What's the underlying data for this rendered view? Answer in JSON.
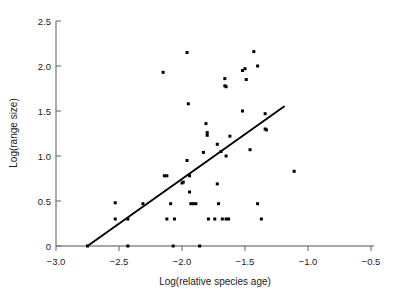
{
  "chart_data": {
    "type": "scatter",
    "title": "",
    "xlabel": "Log(relative species age)",
    "ylabel": "Log(range size)",
    "xlim": [
      -3.0,
      -0.5
    ],
    "ylim": [
      0,
      2.5
    ],
    "grid": false,
    "legend": null,
    "xticks": [
      -3.0,
      -2.5,
      -2.0,
      -1.5,
      -1.0,
      -0.5
    ],
    "xtick_labels": [
      "−3.0",
      "−2.5",
      "−2.0",
      "−1.5",
      "−1.0",
      "−0.5"
    ],
    "yticks": [
      0,
      0.5,
      1.0,
      1.5,
      2.0,
      2.5
    ],
    "ytick_labels": [
      "0",
      "0.5",
      "1.0",
      "1.5",
      "2.0",
      "2.5"
    ],
    "marker": "filled-square",
    "marker_color": "#000000",
    "points": [
      {
        "x": -2.75,
        "y": 0.0
      },
      {
        "x": -2.53,
        "y": 0.48
      },
      {
        "x": -2.53,
        "y": 0.3
      },
      {
        "x": -2.43,
        "y": 0.3
      },
      {
        "x": -2.43,
        "y": 0.0
      },
      {
        "x": -2.31,
        "y": 0.47
      },
      {
        "x": -2.15,
        "y": 1.93
      },
      {
        "x": -2.14,
        "y": 0.78
      },
      {
        "x": -2.12,
        "y": 0.78
      },
      {
        "x": -2.12,
        "y": 0.3
      },
      {
        "x": -2.09,
        "y": 0.47
      },
      {
        "x": -2.06,
        "y": 0.3
      },
      {
        "x": -2.07,
        "y": 0.0
      },
      {
        "x": -2.0,
        "y": 0.7
      },
      {
        "x": -1.99,
        "y": 0.71
      },
      {
        "x": -1.96,
        "y": 2.15
      },
      {
        "x": -1.96,
        "y": 0.95
      },
      {
        "x": -1.95,
        "y": 1.58
      },
      {
        "x": -1.94,
        "y": 0.78
      },
      {
        "x": -1.94,
        "y": 0.6
      },
      {
        "x": -1.93,
        "y": 0.47
      },
      {
        "x": -1.91,
        "y": 0.47
      },
      {
        "x": -1.89,
        "y": 0.47
      },
      {
        "x": -1.86,
        "y": 0.0
      },
      {
        "x": -1.83,
        "y": 1.04
      },
      {
        "x": -1.81,
        "y": 1.36
      },
      {
        "x": -1.8,
        "y": 1.26
      },
      {
        "x": -1.8,
        "y": 1.23
      },
      {
        "x": -1.79,
        "y": 0.3
      },
      {
        "x": -1.74,
        "y": 0.3
      },
      {
        "x": -1.72,
        "y": 1.13
      },
      {
        "x": -1.72,
        "y": 0.69
      },
      {
        "x": -1.71,
        "y": 0.47
      },
      {
        "x": -1.69,
        "y": 1.05
      },
      {
        "x": -1.68,
        "y": 0.3
      },
      {
        "x": -1.66,
        "y": 1.86
      },
      {
        "x": -1.66,
        "y": 1.78
      },
      {
        "x": -1.65,
        "y": 1.77
      },
      {
        "x": -1.65,
        "y": 1.0
      },
      {
        "x": -1.65,
        "y": 0.3
      },
      {
        "x": -1.63,
        "y": 0.3
      },
      {
        "x": -1.62,
        "y": 1.22
      },
      {
        "x": -1.52,
        "y": 1.95
      },
      {
        "x": -1.52,
        "y": 1.5
      },
      {
        "x": -1.5,
        "y": 1.97
      },
      {
        "x": -1.49,
        "y": 1.85
      },
      {
        "x": -1.46,
        "y": 1.07
      },
      {
        "x": -1.43,
        "y": 2.16
      },
      {
        "x": -1.4,
        "y": 2.0
      },
      {
        "x": -1.4,
        "y": 0.47
      },
      {
        "x": -1.37,
        "y": 0.3
      },
      {
        "x": -1.34,
        "y": 1.47
      },
      {
        "x": -1.34,
        "y": 1.3
      },
      {
        "x": -1.33,
        "y": 1.29
      },
      {
        "x": -1.11,
        "y": 0.83
      }
    ],
    "fit_line": {
      "label": "regression-line",
      "x_start": -2.75,
      "y_start": 0.0,
      "x_end": -1.19,
      "y_end": 1.55
    }
  }
}
